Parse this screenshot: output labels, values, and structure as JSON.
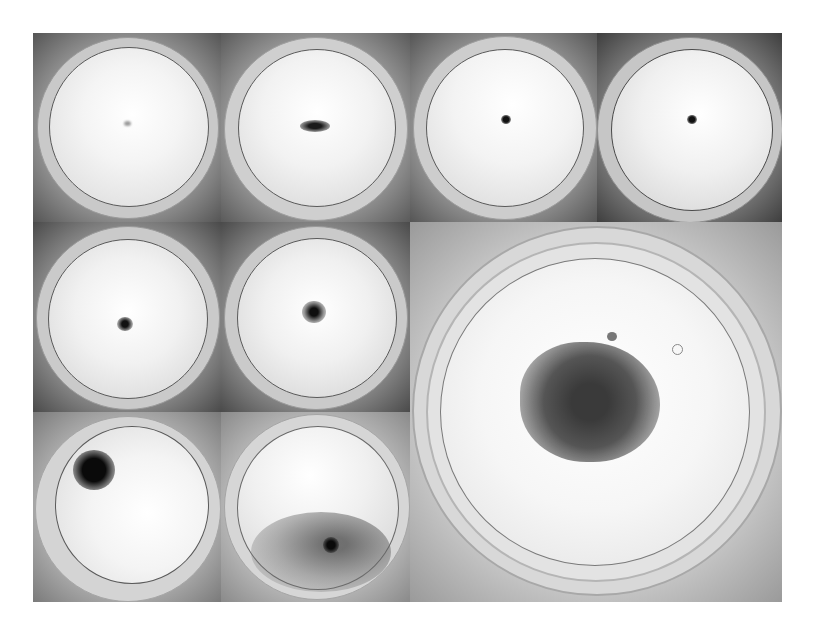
{
  "figure": {
    "layout": "3x4 grid with one enlarged 2x2 panel",
    "panels": [
      {
        "id": "p1",
        "row": 1,
        "col": 1,
        "colony": "faint small speck at center",
        "colony_color": "#9a9a9a",
        "cx": 50,
        "cy": 48,
        "r": 3,
        "bg_dark": "#555555"
      },
      {
        "id": "p2",
        "row": 1,
        "col": 2,
        "colony": "small elongated dark cluster",
        "colony_color": "#2a2a2a",
        "cx": 50,
        "cy": 50,
        "r": 9,
        "bg_dark": "#5a5a5a"
      },
      {
        "id": "p3",
        "row": 1,
        "col": 3,
        "colony": "small dark dot with faint radiating filaments",
        "colony_color": "#222222",
        "cx": 51,
        "cy": 46,
        "r": 4,
        "bg_dark": "#555555"
      },
      {
        "id": "p4",
        "row": 1,
        "col": 4,
        "colony": "dark dot with spreading thin filaments",
        "colony_color": "#1e1e1e",
        "cx": 52,
        "cy": 46,
        "r": 4,
        "bg_dark": "#3e3e3e"
      },
      {
        "id": "p5",
        "row": 2,
        "col": 1,
        "colony": "dark center with radiating filaments",
        "colony_color": "#232323",
        "cx": 50,
        "cy": 54,
        "r": 5,
        "bg_dark": "#4a4a4a"
      },
      {
        "id": "p6",
        "row": 2,
        "col": 2,
        "colony": "dark center with dense radiating filaments",
        "colony_color": "#1c1c1c",
        "cx": 50,
        "cy": 50,
        "r": 6,
        "bg_dark": "#4a4a4a"
      },
      {
        "id": "p7",
        "row": 3,
        "col": 1,
        "colony": "large dense dark colony upper-left",
        "colony_color": "#111111",
        "cx": 32,
        "cy": 32,
        "r": 11,
        "bg_dark": "#7a7a7a"
      },
      {
        "id": "p8",
        "row": 3,
        "col": 2,
        "colony": "diffuse spreading growth lower half with dark center",
        "colony_color": "#1a1a1a",
        "cx": 58,
        "cy": 69,
        "r": 5,
        "bg_dark": "#8a8a8a"
      },
      {
        "id": "p9",
        "row": 2,
        "col": 3,
        "rowspan": 2,
        "colspan": 2,
        "colony": "large branched fractal-like cluster",
        "colony_color": "#4a4a4a",
        "cx": 51,
        "cy": 52,
        "r": 16,
        "bg_dark": "#9a9a9a"
      }
    ]
  }
}
